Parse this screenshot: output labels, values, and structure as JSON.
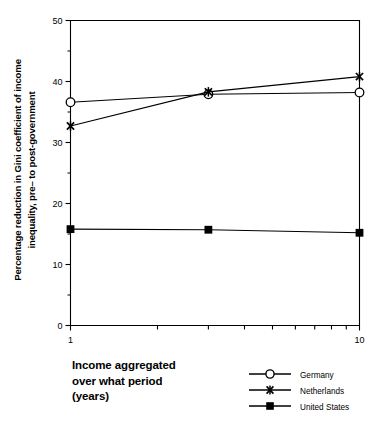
{
  "chart_data": {
    "type": "line",
    "title": "",
    "xlabel": "Income aggregated over what period (years)",
    "ylabel": "Percentage reduction in Gini coefficient of income inequality, pre– to post-government",
    "x": [
      1,
      3,
      10
    ],
    "xtick_labels": [
      "1",
      "10"
    ],
    "xlim": [
      1,
      10
    ],
    "xscale": "log",
    "ylim": [
      0,
      50
    ],
    "yticks": [
      0,
      10,
      20,
      30,
      40,
      50
    ],
    "ytick_labels": [
      "0",
      "10",
      "20",
      "30",
      "40",
      "50"
    ],
    "yminor_ticks": [
      5,
      15,
      25,
      35,
      45
    ],
    "grid": false,
    "legend_position": "bottom-right",
    "series": [
      {
        "name": "Germany",
        "marker": "open-circle",
        "values": [
          36.6,
          37.9,
          38.2
        ]
      },
      {
        "name": "Netherlands",
        "marker": "x-cross",
        "values": [
          32.7,
          38.3,
          40.8
        ]
      },
      {
        "name": "United States",
        "marker": "filled-square",
        "values": [
          15.8,
          15.7,
          15.2
        ]
      }
    ]
  },
  "axes": {
    "ylabel_line1": "Percentage reduction in Gini coefficient of income",
    "ylabel_line2": "inequality, pre– to post-government",
    "xtick_left": "1",
    "xtick_right": "10",
    "ytick_0": "0",
    "ytick_10": "10",
    "ytick_20": "20",
    "ytick_30": "30",
    "ytick_40": "40",
    "ytick_50": "50"
  },
  "xtitle": {
    "line1": "Income aggregated",
    "line2": "over what period",
    "line3": "(years)"
  },
  "legend": {
    "items": [
      {
        "label": "Germany",
        "marker": "open-circle"
      },
      {
        "label": "Netherlands",
        "marker": "x-cross"
      },
      {
        "label": "United States",
        "marker": "filled-square"
      }
    ]
  },
  "colors": {
    "ink": "#000000",
    "background": "#ffffff"
  }
}
